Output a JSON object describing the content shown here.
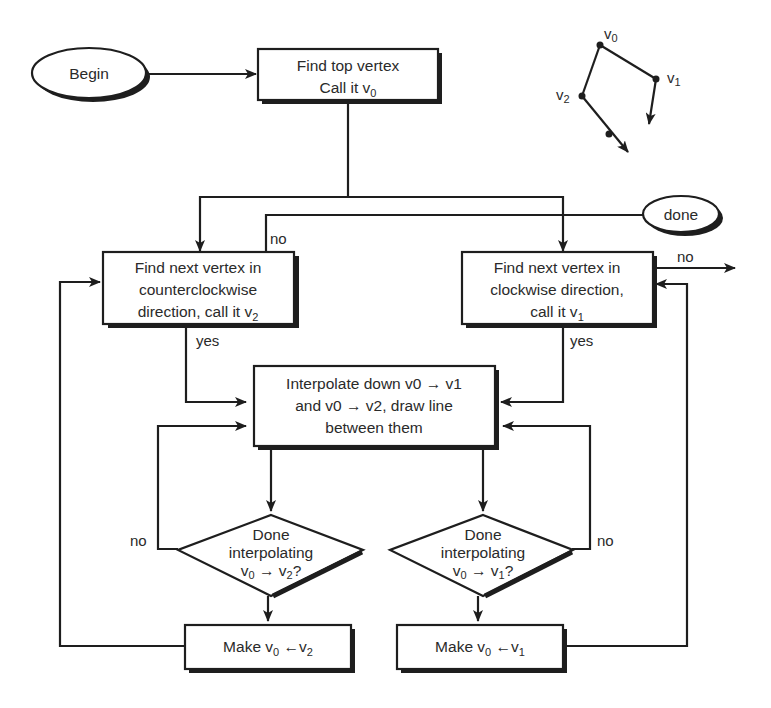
{
  "nodes": {
    "begin": {
      "label": "Begin"
    },
    "find_top": {
      "line1": "Find top vertex",
      "line2_prefix": "Call it v",
      "line2_sub": "0"
    },
    "done": {
      "label": "done"
    },
    "find_ccw": {
      "line1": "Find next vertex in",
      "line2": "counterclockwise",
      "line3_prefix": "direction, call it v",
      "line3_sub": "2"
    },
    "find_cw": {
      "line1": "Find next vertex in",
      "line2": "clockwise direction,",
      "line3_prefix": "call it v",
      "line3_sub": "1"
    },
    "interpolate": {
      "line1": "Interpolate down v0 → v1",
      "line2": "and v0 → v2, draw line",
      "line3": "between them"
    },
    "decision_left": {
      "line1": "Done",
      "line2": "interpolating",
      "line3_a": "v",
      "line3_a_sub": "0",
      "line3_arrow": " → v",
      "line3_b_sub": "2",
      "line3_end": "?"
    },
    "decision_right": {
      "line1": "Done",
      "line2": "interpolating",
      "line3_a": "v",
      "line3_a_sub": "0",
      "line3_arrow": " → v",
      "line3_b_sub": "1",
      "line3_end": "?"
    },
    "make_left": {
      "prefix": "Make v",
      "sub1": "0",
      "mid": " ←v",
      "sub2": "2"
    },
    "make_right": {
      "prefix": "Make v",
      "sub1": "0",
      "mid": " ←v",
      "sub2": "1"
    }
  },
  "edge_labels": {
    "ccw_no": "no",
    "ccw_yes": "yes",
    "cw_no": "no",
    "cw_yes": "yes",
    "left_decision_no": "no",
    "right_decision_no": "no"
  },
  "inset": {
    "v0": "v0",
    "v1": "v1",
    "v2": "v2",
    "v0_label": "v",
    "v0_sub": "0",
    "v1_label": "v",
    "v1_sub": "1",
    "v2_label": "v",
    "v2_sub": "2"
  },
  "colors": {
    "stroke": "#1e1e1e",
    "text": "#2a2a2a",
    "background": "#ffffff"
  }
}
